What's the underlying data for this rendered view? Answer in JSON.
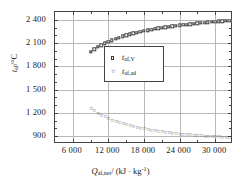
{
  "chart_data": {
    "type": "scatter",
    "title": "",
    "xlabel": "Q_af,net/ (kJ·kg^-1)",
    "ylabel": "t_af/°C",
    "xlim": [
      3000,
      33000
    ],
    "ylim": [
      800,
      2500
    ],
    "grid": true,
    "legend_position": "inside-upper-center",
    "x_ticks": [
      6000,
      12000,
      18000,
      24000,
      30000
    ],
    "x_tick_labels": [
      "6 000",
      "12 000",
      "18 000",
      "24 000",
      "30 000"
    ],
    "y_ticks": [
      900,
      1200,
      1500,
      1800,
      2100,
      2400
    ],
    "y_tick_labels": [
      "900",
      "1 200",
      "1 500",
      "1 800",
      "2 100",
      "2 400"
    ],
    "series": [
      {
        "name": "t_af,V",
        "marker": "open-square",
        "x": [
          9000,
          9600,
          10200,
          10800,
          11400,
          12000,
          12600,
          13200,
          13800,
          14400,
          15000,
          15600,
          16200,
          16800,
          17400,
          18000,
          18600,
          19200,
          19800,
          20400,
          21000,
          21600,
          22200,
          22800,
          23400,
          24000,
          24600,
          25200,
          25800,
          26400,
          27000,
          27600,
          28200,
          28800,
          29400,
          30000,
          30600,
          31200,
          31800,
          32400
        ],
        "y": [
          1990,
          2020,
          2048,
          2073,
          2096,
          2117,
          2136,
          2154,
          2170,
          2185,
          2199,
          2212,
          2224,
          2235,
          2246,
          2256,
          2265,
          2274,
          2282,
          2290,
          2297,
          2304,
          2311,
          2317,
          2323,
          2329,
          2334,
          2339,
          2344,
          2349,
          2354,
          2358,
          2362,
          2366,
          2370,
          2374,
          2378,
          2382,
          2386,
          2390
        ]
      },
      {
        "name": "t_af,ad",
        "marker": "open-star",
        "x": [
          9000,
          9600,
          10200,
          10800,
          11400,
          12000,
          12600,
          13200,
          13800,
          14400,
          15000,
          15600,
          16200,
          16800,
          17400,
          18000,
          18600,
          19200,
          19800,
          20400,
          21000,
          21600,
          22200,
          22800,
          23400,
          24000,
          24600,
          25200,
          25800,
          26400,
          27000,
          27600,
          28200,
          28800,
          29400,
          30000,
          30600,
          31200,
          31800,
          32400
        ],
        "y": [
          1250,
          1219,
          1191,
          1165,
          1142,
          1121,
          1102,
          1085,
          1069,
          1054,
          1041,
          1028,
          1017,
          1006,
          996,
          987,
          978,
          970,
          963,
          956,
          949,
          943,
          937,
          932,
          927,
          922,
          918,
          914,
          910,
          906,
          903,
          899,
          896,
          893,
          891,
          888,
          886,
          883,
          881,
          879
        ]
      }
    ]
  },
  "axis": {
    "y_title_var": "t",
    "y_title_sub": "af",
    "y_title_unit": "/°C",
    "x_title_var": "Q",
    "x_title_sub": "af,net",
    "x_title_unit": "/ (kJ · kg",
    "x_title_sup": "-1",
    "x_title_close": ")"
  },
  "legend": {
    "entries": [
      {
        "marker": "open-square",
        "var": "t",
        "sub": "af,V"
      },
      {
        "marker": "open-star",
        "var": "t",
        "sub": "af,ad"
      }
    ]
  }
}
